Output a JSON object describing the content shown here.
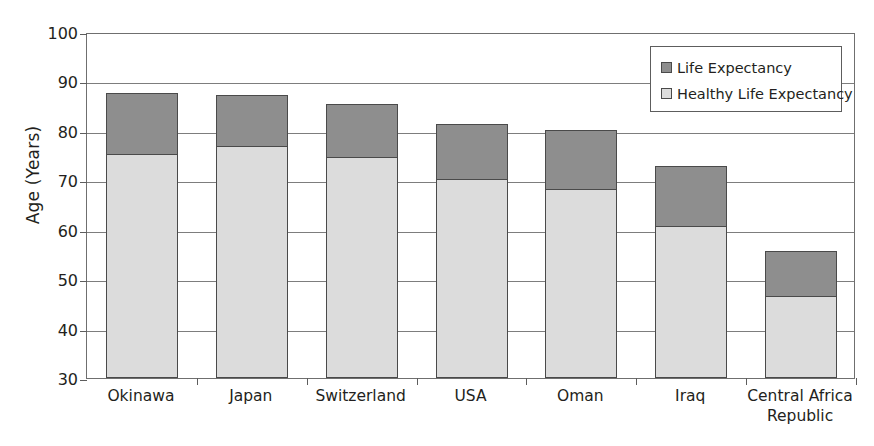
{
  "chart_data": {
    "type": "bar",
    "subtype": "stacked",
    "title": "",
    "xlabel": "",
    "ylabel": "Age (Years)",
    "ylim": [
      30,
      100
    ],
    "ytick_step": 10,
    "yticks": [
      100,
      90,
      80,
      70,
      60,
      50,
      40,
      30
    ],
    "grid": true,
    "legend_position": "top-right",
    "categories": [
      "Okinawa",
      "Japan",
      "Switzerland",
      "USA",
      "Oman",
      "Iraq",
      "Central Africa Republic"
    ],
    "category_lines": [
      [
        "Okinawa"
      ],
      [
        "Japan"
      ],
      [
        "Switzerland"
      ],
      [
        "USA"
      ],
      [
        "Oman"
      ],
      [
        "Iraq"
      ],
      [
        "Central Africa",
        "Republic"
      ]
    ],
    "series": [
      {
        "name": "Healthy Life Expectancy",
        "color": "#dcdcdc",
        "values": [
          75.3,
          76.9,
          74.7,
          70.3,
          68.2,
          60.7,
          46.6
        ]
      },
      {
        "name": "Life Expectancy",
        "color": "#8e8e8e",
        "values": [
          87.7,
          87.3,
          85.4,
          81.4,
          80.2,
          72.9,
          55.6
        ]
      }
    ]
  },
  "legend": {
    "items": [
      {
        "label": "Life Expectancy",
        "swatch": "dark"
      },
      {
        "label": "Healthy Life Expectancy",
        "swatch": "light"
      }
    ]
  },
  "axis": {
    "y_title": "Age (Years)"
  }
}
